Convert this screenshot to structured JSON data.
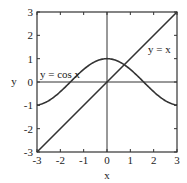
{
  "chart_data": {
    "type": "line",
    "title": "",
    "xlabel": "x",
    "ylabel": "y",
    "xlim": [
      -3,
      3
    ],
    "ylim": [
      -3,
      3
    ],
    "xticks": [
      -3,
      -2,
      -1,
      0,
      1,
      2,
      3
    ],
    "yticks": [
      -3,
      -2,
      -1,
      0,
      1,
      2,
      3
    ],
    "xtick_labels": [
      "-3",
      "-2",
      "-1",
      "0",
      "1",
      "2",
      "3"
    ],
    "ytick_labels": [
      "-3",
      "-2",
      "-1",
      "0",
      "1",
      "2",
      "3"
    ],
    "grid": false,
    "zero_lines": true,
    "legend": null,
    "series": [
      {
        "name": "y = cos x",
        "function": "cos(x)",
        "x": [
          -3,
          -2.5,
          -2,
          -1.5,
          -1,
          -0.5,
          0,
          0.5,
          1,
          1.5,
          2,
          2.5,
          3
        ],
        "y": [
          -0.99,
          -0.8,
          -0.42,
          0.07,
          0.54,
          0.88,
          1.0,
          0.88,
          0.54,
          0.07,
          -0.42,
          -0.8,
          -0.99
        ],
        "color": "#333333"
      },
      {
        "name": "y = x",
        "function": "x",
        "x": [
          -3,
          3
        ],
        "y": [
          -3,
          3
        ],
        "color": "#333333"
      }
    ],
    "annotations": [
      {
        "text": "y = cos x",
        "x": -2.95,
        "y": 0.85
      },
      {
        "text": "y = x",
        "x": 1.55,
        "y": 1.85
      }
    ]
  },
  "labels": {
    "xlabel": "x",
    "ylabel": "y",
    "annot_cos": "y = cos x",
    "annot_line": "y = x"
  },
  "colors": {
    "axis": "#333333",
    "curve": "#333333",
    "text": "#222222"
  }
}
